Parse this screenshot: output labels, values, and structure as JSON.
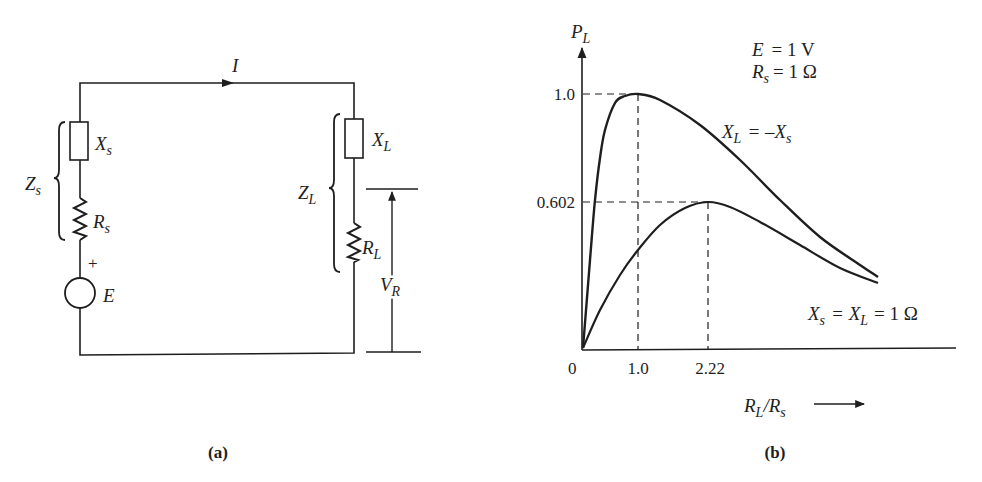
{
  "panel_a": {
    "caption": "(a)",
    "current_label": "I",
    "source": {
      "impedance_label": "Z",
      "impedance_sub": "s",
      "reactance_label": "X",
      "reactance_sub": "s",
      "resistance_label": "R",
      "resistance_sub": "s",
      "emf_label": "E",
      "polarity": "+"
    },
    "load": {
      "impedance_label": "Z",
      "impedance_sub": "L",
      "reactance_label": "X",
      "reactance_sub": "L",
      "resistance_label": "R",
      "resistance_sub": "L"
    },
    "voltage_label": "V",
    "voltage_sub": "R"
  },
  "panel_b": {
    "caption": "(b)",
    "y_axis_label": "P",
    "y_axis_sub": "L",
    "x_axis_label_num": "R",
    "x_axis_sub_num": "L",
    "x_axis_slash": "/",
    "x_axis_label_den": "R",
    "x_axis_sub_den": "s",
    "params": {
      "line1_var": "E",
      "line1_val": "= 1 V",
      "line2_var": "R",
      "line2_sub": "s",
      "line2_val": "= 1 Ω"
    },
    "curve1_label": {
      "a": "X",
      "a_sub": "L",
      "eq": "= –X",
      "b_sub": "s"
    },
    "curve2_label": {
      "a": "X",
      "a_sub": "s",
      "eq": "= X",
      "b_sub": "L",
      "tail": "= 1 Ω"
    },
    "ticks": {
      "origin": "0",
      "x1": "1.0",
      "x2": "2.22",
      "y1": "1.0",
      "y2": "0.602"
    }
  },
  "chart_data": {
    "type": "line",
    "title": "",
    "xlabel": "R_L/R_s",
    "ylabel": "P_L",
    "annotations": [
      "E = 1 V",
      "R_s = 1 Ω"
    ],
    "x_ticks": [
      "0",
      "1.0",
      "2.22"
    ],
    "y_ticks": [
      "1.0",
      "0.602"
    ],
    "grid": false,
    "series": [
      {
        "name": "X_L = –X_s",
        "peak": {
          "x": 1.0,
          "y": 1.0
        },
        "pixel_path": [
          [
            583,
            348
          ],
          [
            590,
            260
          ],
          [
            595,
            200
          ],
          [
            600,
            158
          ],
          [
            605,
            130
          ],
          [
            615,
            103
          ],
          [
            625,
            96
          ],
          [
            638,
            94
          ],
          [
            660,
            100
          ],
          [
            700,
            125
          ],
          [
            740,
            160
          ],
          [
            780,
            200
          ],
          [
            820,
            237
          ],
          [
            860,
            265
          ],
          [
            878,
            277
          ]
        ]
      },
      {
        "name": "X_s = X_L = 1 Ω",
        "peak": {
          "x": 2.22,
          "y": 0.602
        },
        "pixel_path": [
          [
            583,
            348
          ],
          [
            600,
            310
          ],
          [
            620,
            275
          ],
          [
            638,
            250
          ],
          [
            660,
            225
          ],
          [
            685,
            208
          ],
          [
            708,
            202
          ],
          [
            730,
            207
          ],
          [
            760,
            222
          ],
          [
            800,
            245
          ],
          [
            840,
            268
          ],
          [
            878,
            283
          ]
        ]
      }
    ],
    "axes_pixels": {
      "origin": [
        582,
        350
      ],
      "x_end": 955,
      "y_top": 70,
      "x_1": 638,
      "x_2_22": 708,
      "y_1": 94,
      "y_0_602": 202
    }
  }
}
